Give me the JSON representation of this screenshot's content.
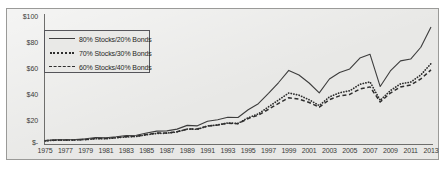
{
  "chart_data": {
    "type": "line",
    "title": "",
    "subtitle": "",
    "xlabel": "",
    "ylabel": "",
    "grid": false,
    "legend_position": "upper-left-inside",
    "ylim": [
      0,
      100
    ],
    "ytick_labels": [
      "$100",
      "$80",
      "$60",
      "$40",
      "$20",
      "$-"
    ],
    "ytick_values": [
      100,
      80,
      60,
      40,
      20,
      0
    ],
    "xlim": [
      1975,
      2013
    ],
    "xtick_labels": [
      "1975",
      "1977",
      "1979",
      "1981",
      "1983",
      "1985",
      "1987",
      "1989",
      "1991",
      "1993",
      "1995",
      "1997",
      "1999",
      "2001",
      "2003",
      "2005",
      "2007",
      "2009",
      "2011",
      "2013"
    ],
    "xtick_values": [
      1975,
      1977,
      1979,
      1981,
      1983,
      1985,
      1987,
      1989,
      1991,
      1993,
      1995,
      1997,
      1999,
      2001,
      2003,
      2005,
      2007,
      2009,
      2011,
      2013
    ],
    "x": [
      1975,
      1976,
      1977,
      1978,
      1979,
      1980,
      1981,
      1982,
      1983,
      1984,
      1985,
      1986,
      1987,
      1988,
      1989,
      1990,
      1991,
      1992,
      1993,
      1994,
      1995,
      1996,
      1997,
      1998,
      1999,
      2000,
      2001,
      2002,
      2003,
      2004,
      2005,
      2006,
      2007,
      2008,
      2009,
      2010,
      2011,
      2012,
      2013
    ],
    "series": [
      {
        "name": "80% Stocks/20% Bonds",
        "style": "solid",
        "color": "#3d3d3d",
        "values": [
          1.0,
          1.3,
          1.3,
          1.4,
          1.7,
          2.2,
          2.1,
          2.5,
          3.0,
          3.1,
          4.0,
          4.7,
          4.8,
          5.5,
          7.0,
          6.8,
          8.6,
          9.2,
          10.2,
          10.1,
          13.2,
          15.6,
          19.7,
          24.0,
          28.8,
          27.0,
          23.8,
          19.9,
          25.4,
          28.0,
          29.4,
          33.7,
          35.2,
          22.4,
          28.6,
          32.6,
          33.3,
          38.0,
          46.0
        ]
      },
      {
        "name": "70% Stocks/30% Bonds",
        "style": "dotted",
        "color": "#2e2e2e",
        "values": [
          1.0,
          1.3,
          1.3,
          1.4,
          1.6,
          2.0,
          2.0,
          2.4,
          2.8,
          3.0,
          3.8,
          4.4,
          4.5,
          5.1,
          6.4,
          6.3,
          7.8,
          8.3,
          9.2,
          9.0,
          11.6,
          13.4,
          16.6,
          19.8,
          23.0,
          22.0,
          19.9,
          17.2,
          21.2,
          23.1,
          24.0,
          27.0,
          28.1,
          19.6,
          24.1,
          27.2,
          28.0,
          31.3,
          36.5
        ]
      },
      {
        "name": "60% Stocks/40% Bonds",
        "style": "dashed",
        "color": "#2e2e2e",
        "values": [
          1.0,
          1.2,
          1.3,
          1.3,
          1.5,
          1.9,
          1.9,
          2.3,
          2.7,
          2.9,
          3.6,
          4.2,
          4.2,
          4.8,
          5.9,
          5.9,
          7.2,
          7.6,
          8.4,
          8.2,
          10.4,
          11.8,
          14.3,
          16.8,
          19.2,
          18.6,
          17.2,
          15.2,
          18.4,
          20.0,
          20.6,
          22.9,
          23.8,
          17.4,
          21.2,
          23.8,
          24.6,
          27.2,
          31.0
        ]
      }
    ],
    "note_values_unit": "dollars (growth of $1)",
    "endpoint_values_2013": {
      "80_20": 92,
      "70_30": 63,
      "60_40": 58
    }
  },
  "legend": {
    "items": [
      {
        "label": "80% Stocks/20% Bonds",
        "style": "solid"
      },
      {
        "label": "70% Stocks/30% Bonds",
        "style": "dotted"
      },
      {
        "label": "60% Stocks/40% Bonds",
        "style": "dashed"
      }
    ]
  },
  "colors": {
    "plot_background": "#e8e8e6",
    "border": "#9a9a98",
    "axis": "#6e6e6c",
    "text": "#3a3a38",
    "line_primary": "#3d3d3d",
    "line_secondary": "#2e2e2e"
  }
}
